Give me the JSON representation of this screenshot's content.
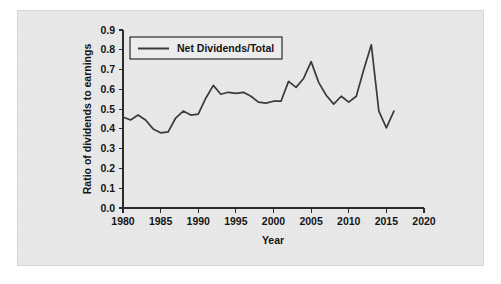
{
  "figure": {
    "panel_background": "#e9e9e9",
    "page_background": "#ffffff"
  },
  "chart_data": {
    "type": "line",
    "title": "",
    "xlabel": "Year",
    "ylabel": "Ratio of dividends to earnings",
    "xlim": [
      1980,
      2020
    ],
    "ylim": [
      0.0,
      0.9
    ],
    "xticks": [
      1980,
      1985,
      1990,
      1995,
      2000,
      2005,
      2010,
      2015,
      2020
    ],
    "xtick_labels": [
      "1980",
      "1985",
      "1990",
      "1995",
      "2000",
      "2005",
      "2010",
      "2015",
      "2020"
    ],
    "yticks": [
      0.0,
      0.1,
      0.2,
      0.3,
      0.4,
      0.5,
      0.6,
      0.7,
      0.8,
      0.9
    ],
    "ytick_labels": [
      "0.0",
      "0.1",
      "0.2",
      "0.3",
      "0.4",
      "0.5",
      "0.6",
      "0.7",
      "0.8",
      "0.9"
    ],
    "grid": false,
    "legend_position": "upper left",
    "legend_entries": [
      "Net Dividends/Total"
    ],
    "line_color": "#3a3a3a",
    "series": [
      {
        "name": "Net Dividends/Total",
        "color": "#3a3a3a",
        "x": [
          1980,
          1981,
          1982,
          1983,
          1984,
          1985,
          1986,
          1987,
          1988,
          1989,
          1990,
          1991,
          1992,
          1993,
          1994,
          1995,
          1996,
          1997,
          1998,
          1999,
          2000,
          2001,
          2002,
          2003,
          2004,
          2005,
          2006,
          2007,
          2008,
          2009,
          2010,
          2011,
          2012,
          2013,
          2014,
          2015,
          2016
        ],
        "values": [
          0.46,
          0.44,
          0.47,
          0.45,
          0.4,
          0.38,
          0.38,
          0.45,
          0.49,
          0.47,
          0.48,
          0.55,
          0.62,
          0.58,
          0.58,
          0.58,
          0.59,
          0.57,
          0.54,
          0.53,
          0.53,
          0.54,
          0.54,
          0.64,
          0.61,
          0.65,
          0.74,
          0.68,
          0.59,
          0.53,
          0.55,
          0.57,
          0.54,
          0.6,
          0.72,
          0.82,
          0.62
        ],
        "annual_readings": {
          "1980": 0.46,
          "1984": 0.38,
          "1990": 0.62,
          "1995": 0.53,
          "2000": 0.74,
          "2008": 0.82,
          "2010": 0.4,
          "2015": 0.64,
          "2016": 0.61
        }
      }
    ],
    "plotted_points": [
      {
        "year": 1980,
        "value": 0.46
      },
      {
        "year": 1981,
        "value": 0.445
      },
      {
        "year": 1982,
        "value": 0.47
      },
      {
        "year": 1983,
        "value": 0.445
      },
      {
        "year": 1984,
        "value": 0.4
      },
      {
        "year": 1985,
        "value": 0.38
      },
      {
        "year": 1986,
        "value": 0.385
      },
      {
        "year": 1987,
        "value": 0.455
      },
      {
        "year": 1988,
        "value": 0.49
      },
      {
        "year": 1989,
        "value": 0.47
      },
      {
        "year": 1990,
        "value": 0.475
      },
      {
        "year": 1991,
        "value": 0.555
      },
      {
        "year": 1992,
        "value": 0.62
      },
      {
        "year": 1993,
        "value": 0.575
      },
      {
        "year": 1994,
        "value": 0.585
      },
      {
        "year": 1995,
        "value": 0.58
      },
      {
        "year": 1996,
        "value": 0.585
      },
      {
        "year": 1997,
        "value": 0.565
      },
      {
        "year": 1998,
        "value": 0.535
      },
      {
        "year": 1999,
        "value": 0.53
      },
      {
        "year": 2000,
        "value": 0.54
      },
      {
        "year": 2001,
        "value": 0.54
      },
      {
        "year": 2002,
        "value": 0.64
      },
      {
        "year": 2003,
        "value": 0.61
      },
      {
        "year": 2004,
        "value": 0.655
      },
      {
        "year": 2005,
        "value": 0.74
      },
      {
        "year": 2006,
        "value": 0.635
      },
      {
        "year": 2007,
        "value": 0.57
      },
      {
        "year": 2008,
        "value": 0.525
      },
      {
        "year": 2009,
        "value": 0.565
      },
      {
        "year": 2010,
        "value": 0.535
      },
      {
        "year": 2011,
        "value": 0.565
      },
      {
        "year": 2012,
        "value": 0.7
      },
      {
        "year": 2013,
        "value": 0.825
      },
      {
        "year": 2014,
        "value": 0.49
      },
      {
        "year": 2015,
        "value": 0.405
      },
      {
        "year": 2016,
        "value": 0.49
      }
    ]
  },
  "accessibility": {
    "figure_role": "line chart of dividend payout ratio over time"
  }
}
